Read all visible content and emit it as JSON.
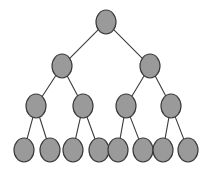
{
  "figure": {
    "background_color": "#ffffff",
    "node_fill_color": "#9a9a9a",
    "node_stroke_color": "#3a3a3a",
    "edge_color": "#3b3b3b",
    "node_shape": "ellipse",
    "node_rx": 10,
    "node_ry": 12,
    "depth": 4,
    "node_count": 15,
    "edge_count": 14,
    "branching_factor": 2
  },
  "chart_data": {
    "type": "diagram",
    "title": "",
    "levels": [
      {
        "level": 1,
        "count": 1,
        "y": 22,
        "nodes": [
          {
            "id": "n1",
            "label": "",
            "cx": 106,
            "cy": 22
          }
        ]
      },
      {
        "level": 2,
        "count": 2,
        "y": 66,
        "nodes": [
          {
            "id": "n2",
            "label": "",
            "cx": 62,
            "cy": 66
          },
          {
            "id": "n3",
            "label": "",
            "cx": 150,
            "cy": 66
          }
        ]
      },
      {
        "level": 3,
        "count": 4,
        "y": 106,
        "nodes": [
          {
            "id": "n4",
            "label": "",
            "cx": 36,
            "cy": 106
          },
          {
            "id": "n5",
            "label": "",
            "cx": 83,
            "cy": 106
          },
          {
            "id": "n6",
            "label": "",
            "cx": 126,
            "cy": 106
          },
          {
            "id": "n7",
            "label": "",
            "cx": 171,
            "cy": 106
          }
        ]
      },
      {
        "level": 4,
        "count": 8,
        "y": 150,
        "nodes": [
          {
            "id": "n8",
            "label": "",
            "cx": 24,
            "cy": 150
          },
          {
            "id": "n9",
            "label": "",
            "cx": 50,
            "cy": 150
          },
          {
            "id": "n10",
            "label": "",
            "cx": 73,
            "cy": 150
          },
          {
            "id": "n11",
            "label": "",
            "cx": 99,
            "cy": 150
          },
          {
            "id": "n12",
            "label": "",
            "cx": 118,
            "cy": 150
          },
          {
            "id": "n13",
            "label": "",
            "cx": 143,
            "cy": 150
          },
          {
            "id": "n14",
            "label": "",
            "cx": 163,
            "cy": 150
          },
          {
            "id": "n15",
            "label": "",
            "cx": 188,
            "cy": 150
          }
        ]
      }
    ],
    "edges": [
      {
        "from": "n1",
        "to": "n2"
      },
      {
        "from": "n1",
        "to": "n3"
      },
      {
        "from": "n2",
        "to": "n4"
      },
      {
        "from": "n2",
        "to": "n5"
      },
      {
        "from": "n3",
        "to": "n6"
      },
      {
        "from": "n3",
        "to": "n7"
      },
      {
        "from": "n4",
        "to": "n8"
      },
      {
        "from": "n4",
        "to": "n9"
      },
      {
        "from": "n5",
        "to": "n10"
      },
      {
        "from": "n5",
        "to": "n11"
      },
      {
        "from": "n6",
        "to": "n12"
      },
      {
        "from": "n6",
        "to": "n13"
      },
      {
        "from": "n7",
        "to": "n14"
      },
      {
        "from": "n7",
        "to": "n15"
      }
    ]
  }
}
